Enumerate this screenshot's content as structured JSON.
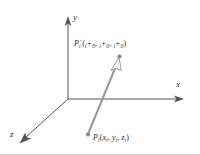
{
  "figure": {
    "background_color": "#ffffff",
    "axis_color": "#555555",
    "vector_color": "#9a9a9a",
    "point_color": "#8c8c8c",
    "text_color": "#2b2b2b",
    "border_color": "#cfcfcf"
  },
  "axes": [
    {
      "name": "y-axis",
      "label": "y",
      "direction": "up",
      "from": [
        68,
        99
      ],
      "to": [
        68,
        22
      ]
    },
    {
      "name": "x-axis",
      "label": "x",
      "direction": "right",
      "from": [
        68,
        99
      ],
      "to": [
        181,
        99
      ]
    },
    {
      "name": "z-axis",
      "label": "z",
      "direction": "down-left",
      "from": [
        68,
        99
      ],
      "to": [
        22,
        141
      ]
    }
  ],
  "axis_labels": {
    "y": "y",
    "x": "x",
    "z": "z"
  },
  "points": {
    "source": {
      "name": "P_i",
      "symbol": "P",
      "symbol_sub": "i",
      "coords": [
        "x",
        "y",
        "z"
      ],
      "coord_sub": "i",
      "label_plain": "Pi(xi, yi, zi)",
      "position": [
        88,
        135
      ]
    },
    "translated": {
      "name": "P_i_prime",
      "symbol": "P",
      "symbol_sub": "i",
      "prime": "′",
      "offset_sub": "0",
      "coord_sub": "i",
      "label_plain": "P'i(xi + x0, yi + y0, zi + z0)",
      "position": [
        119,
        57
      ]
    }
  },
  "vector": {
    "name": "translation-vector",
    "from": [
      88,
      135
    ],
    "to": [
      119,
      60
    ],
    "arrowhead": "hollow-open",
    "color": "#9a9a9a"
  },
  "separators": {
    "comma": ",",
    "plus": "+",
    "open_paren": "(",
    "close_paren": ")"
  }
}
